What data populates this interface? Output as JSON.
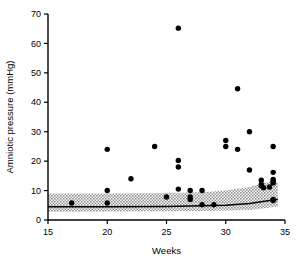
{
  "figure": {
    "width": 300,
    "height": 267,
    "background": "#ffffff",
    "ink": "#000000",
    "band_fill": "#b3b3b3"
  },
  "axes": {
    "x_title": "Weeks",
    "y_title": "Amniotic pressure (mmHg)",
    "x_ticks": [
      "15",
      "20",
      "25",
      "30",
      "35"
    ],
    "y_ticks": [
      "0",
      "10",
      "20",
      "30",
      "40",
      "50",
      "60",
      "70"
    ]
  },
  "chart_data": {
    "type": "scatter",
    "title": "",
    "xlabel": "Weeks",
    "ylabel": "Amniotic pressure (mmHg)",
    "xlim": [
      15,
      35
    ],
    "ylim": [
      0,
      70
    ],
    "xticks": [
      15,
      20,
      25,
      30,
      35
    ],
    "yticks": [
      0,
      10,
      20,
      30,
      40,
      50,
      60,
      70
    ],
    "grid": false,
    "legend": false,
    "points": [
      {
        "x": 17.0,
        "y": 5.8
      },
      {
        "x": 20.0,
        "y": 24.0
      },
      {
        "x": 20.0,
        "y": 10.0
      },
      {
        "x": 20.0,
        "y": 5.8
      },
      {
        "x": 22.0,
        "y": 14.0
      },
      {
        "x": 24.0,
        "y": 25.0
      },
      {
        "x": 25.0,
        "y": 7.8
      },
      {
        "x": 26.0,
        "y": 65.2
      },
      {
        "x": 26.0,
        "y": 20.2
      },
      {
        "x": 26.0,
        "y": 18.0
      },
      {
        "x": 26.0,
        "y": 10.5
      },
      {
        "x": 27.0,
        "y": 10.0
      },
      {
        "x": 27.0,
        "y": 7.8
      },
      {
        "x": 27.0,
        "y": 7.0
      },
      {
        "x": 28.0,
        "y": 10.0
      },
      {
        "x": 28.0,
        "y": 5.2
      },
      {
        "x": 29.0,
        "y": 5.2
      },
      {
        "x": 30.0,
        "y": 27.0
      },
      {
        "x": 30.0,
        "y": 25.0
      },
      {
        "x": 31.0,
        "y": 44.6
      },
      {
        "x": 31.0,
        "y": 24.0
      },
      {
        "x": 32.0,
        "y": 30.0
      },
      {
        "x": 32.0,
        "y": 17.0
      },
      {
        "x": 33.0,
        "y": 13.5
      },
      {
        "x": 33.0,
        "y": 12.2
      },
      {
        "x": 33.0,
        "y": 11.6
      },
      {
        "x": 33.2,
        "y": 11.0
      },
      {
        "x": 34.0,
        "y": 25.0
      },
      {
        "x": 34.0,
        "y": 16.2
      },
      {
        "x": 34.0,
        "y": 13.8
      },
      {
        "x": 34.0,
        "y": 13.2
      },
      {
        "x": 34.0,
        "y": 12.6
      },
      {
        "x": 33.7,
        "y": 11.2
      },
      {
        "x": 34.0,
        "y": 7.0
      },
      {
        "x": 34.0,
        "y": 6.6
      }
    ],
    "reference_band": {
      "label": "shaded reference range",
      "x": [
        15,
        20,
        25,
        28,
        30,
        32,
        33,
        34,
        34.4
      ],
      "upper": [
        9.0,
        9.0,
        9.2,
        9.4,
        10.0,
        11.2,
        12.4,
        13.2,
        12.6
      ],
      "lower": [
        2.8,
        2.9,
        3.0,
        3.1,
        3.2,
        3.4,
        3.8,
        4.4,
        4.5
      ]
    },
    "median_line": {
      "label": "median reference line",
      "x": [
        15,
        20,
        25,
        28,
        30,
        32,
        33,
        34,
        34.4
      ],
      "y": [
        4.5,
        4.5,
        4.6,
        4.8,
        5.0,
        5.6,
        6.2,
        6.8,
        7.0
      ]
    }
  }
}
